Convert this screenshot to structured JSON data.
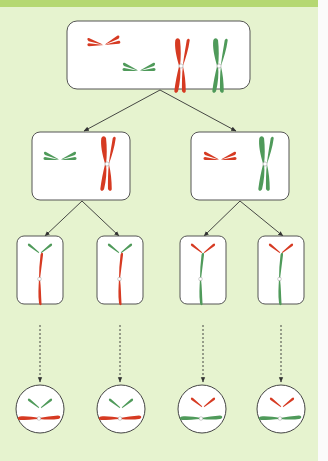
{
  "figure": {
    "colors": {
      "background": "#e6f3cf",
      "header_strip": "#b5d872",
      "cell_fill": "#ffffff",
      "cell_stroke": "#555555",
      "arrow": "#333333",
      "maternal_red": "#d63a22",
      "paternal_green": "#4f9a5a",
      "centromere": "#ffffff"
    },
    "levels": [
      {
        "name": "parent-cell",
        "shape": "rounded-rect",
        "count": 1,
        "contents": "two homologous pairs: small red + small green, large red + large green"
      },
      {
        "name": "meiosis-I-daughters",
        "shape": "rounded-rect",
        "count": 2,
        "contents": [
          "small green + large red",
          "small red + large green"
        ]
      },
      {
        "name": "meiosis-II-products",
        "shape": "rounded-rect",
        "count": 4,
        "contents": [
          "green small + red large",
          "green small + red large",
          "red small + green large",
          "red small + green large"
        ]
      },
      {
        "name": "gametes",
        "shape": "circle",
        "count": 4,
        "contents": [
          "green small + red large",
          "green small + red large",
          "red small + green large",
          "red small + green large"
        ]
      }
    ],
    "connectors": {
      "solid_arrows": 6,
      "dashed_arrows": 4
    }
  }
}
